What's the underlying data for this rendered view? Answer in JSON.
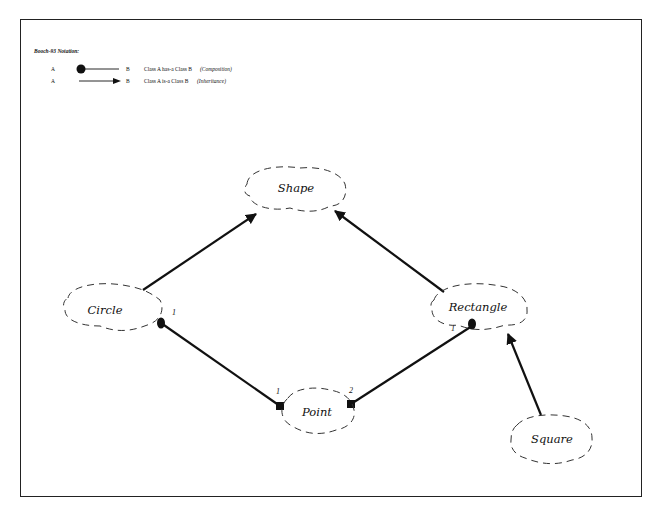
{
  "legend": {
    "title": "Booch-93 Notation:",
    "rows": [
      {
        "from": "A",
        "to": "B",
        "text": "Class A has-a Class B",
        "kind": "(Composition)"
      },
      {
        "from": "A",
        "to": "B",
        "text": "Class A is-a Class B",
        "kind": "(Inheritance)"
      }
    ]
  },
  "classes": {
    "shape": "Shape",
    "circle": "Circle",
    "rectangle": "Rectangle",
    "point": "Point",
    "square": "Square"
  },
  "multiplicities": {
    "circle_end": "1",
    "rectangle_end": "1",
    "point_left": "1",
    "point_right": "2"
  },
  "relationships": [
    {
      "from": "Circle",
      "to": "Shape",
      "type": "inheritance"
    },
    {
      "from": "Rectangle",
      "to": "Shape",
      "type": "inheritance"
    },
    {
      "from": "Square",
      "to": "Rectangle",
      "type": "inheritance"
    },
    {
      "from": "Circle",
      "to": "Point",
      "type": "composition",
      "multiplicity": "1"
    },
    {
      "from": "Rectangle",
      "to": "Point",
      "type": "composition",
      "multiplicity": "2"
    }
  ]
}
